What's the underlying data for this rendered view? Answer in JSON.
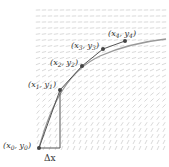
{
  "diagram": {
    "points": [
      {
        "label": "(x0, y0)",
        "x": "x",
        "y": "y",
        "sub": "0",
        "px": 39,
        "py": 148
      },
      {
        "label": "(x1, y1)",
        "x": "x",
        "y": "y",
        "sub": "1",
        "px": 60,
        "py": 90
      },
      {
        "label": "(x2, y2)",
        "x": "x",
        "y": "y",
        "sub": "2",
        "px": 82,
        "py": 66
      },
      {
        "label": "(x3, y3)",
        "x": "x",
        "y": "y",
        "sub": "3",
        "px": 103,
        "py": 49
      },
      {
        "label": "(x4, y4)",
        "x": "x",
        "y": "y",
        "sub": "4",
        "px": 125,
        "py": 41
      }
    ],
    "step_label": "Δx",
    "colors": {
      "euler_line": "#555555",
      "solution_curve": "#999999",
      "points": "#444444",
      "field": "#c8c8c8"
    }
  }
}
